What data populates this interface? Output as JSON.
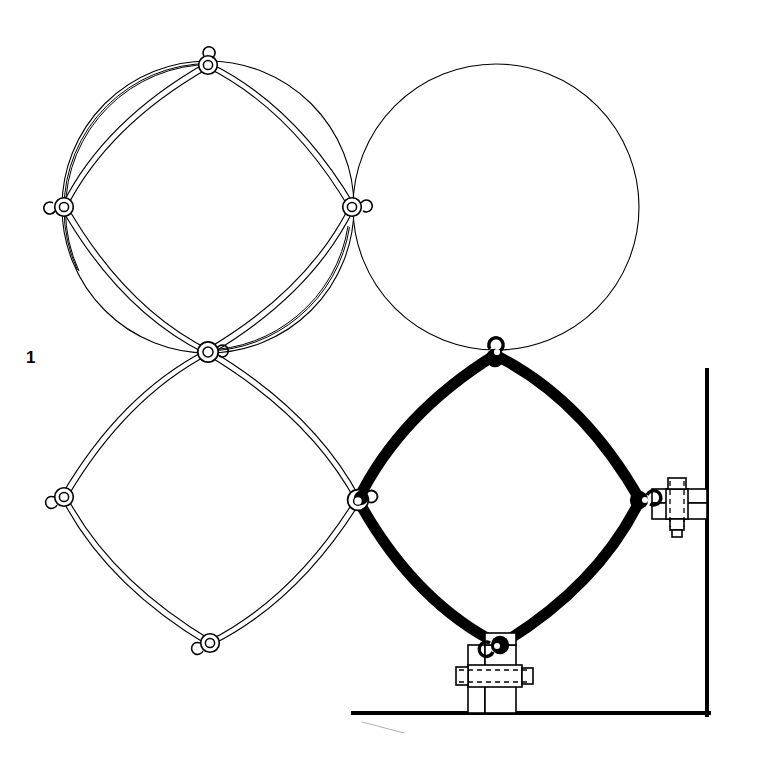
{
  "figure": {
    "label": "1",
    "label_position": {
      "x": 26,
      "y": 349
    },
    "background_color": "#ffffff",
    "line_color": "#000000",
    "canvas": {
      "width": 762,
      "height": 784
    }
  },
  "style": {
    "thin_circle_stroke_width": 1.1,
    "light_member_outline_stroke_width": 1.2,
    "light_member_rod_width": 5.0,
    "bold_member_stroke_width": 11.0,
    "joint_ring_outer_radius": 9.5,
    "joint_ring_inner_radius": 4.6,
    "hardware_stroke_width": 1.6,
    "wall_stroke_width": 4.0,
    "floor_stroke_width": 4.0,
    "dashed_stroke_width": 1.4,
    "dash_pattern": "6,5"
  },
  "geometry": {
    "description": "Square lattice of four-bar concave arc cells; node pitch 145 px on a 45-degree-rotated grid",
    "node_pitch": 145,
    "arc_bulge_ratio": 0.3,
    "nodes": [
      {
        "id": "n-top",
        "x": 208,
        "y": 65,
        "type": "hook-joint",
        "state": "light"
      },
      {
        "id": "n-right-upper",
        "x": 352,
        "y": 207,
        "type": "hook-joint",
        "state": "light"
      },
      {
        "id": "n-left-upper",
        "x": 64,
        "y": 207,
        "type": "hook-joint",
        "state": "light"
      },
      {
        "id": "n-center",
        "x": 208,
        "y": 352,
        "type": "cross-joint",
        "state": "light"
      },
      {
        "id": "n-left-lower",
        "x": 64,
        "y": 497,
        "type": "end-joint",
        "state": "light"
      },
      {
        "id": "n-bottom",
        "x": 210,
        "y": 643,
        "type": "end-joint",
        "state": "light"
      },
      {
        "id": "n-mid",
        "x": 358,
        "y": 500,
        "type": "transition-joint",
        "state": "mixed"
      },
      {
        "id": "n-upper-bold",
        "x": 495,
        "y": 355,
        "type": "hook-joint",
        "state": "bold"
      },
      {
        "id": "n-right-bold",
        "x": 640,
        "y": 500,
        "type": "anchor-joint",
        "state": "bold"
      },
      {
        "id": "n-lower-bold",
        "x": 500,
        "y": 645,
        "type": "anchor-joint",
        "state": "bold"
      }
    ],
    "circles": [
      {
        "id": "circle-top-left",
        "cx": 208,
        "cy": 207,
        "r": 146,
        "state": "light"
      },
      {
        "id": "circle-top-right",
        "cx": 496,
        "cy": 207,
        "r": 143,
        "state": "light"
      }
    ],
    "light_members": [
      {
        "id": "m1",
        "from": "n-top",
        "to": "n-right-upper",
        "bulge": -0.3
      },
      {
        "id": "m2",
        "from": "n-right-upper",
        "to": "n-center",
        "bulge": -0.3
      },
      {
        "id": "m3",
        "from": "n-center",
        "to": "n-left-upper",
        "bulge": -0.3
      },
      {
        "id": "m4",
        "from": "n-left-upper",
        "to": "n-top",
        "bulge": -0.3
      },
      {
        "id": "m5",
        "from": "n-center",
        "to": "n-left-lower",
        "bulge": -0.3
      },
      {
        "id": "m6",
        "from": "n-left-lower",
        "to": "n-bottom",
        "bulge": -0.3
      },
      {
        "id": "m7",
        "from": "n-bottom",
        "to": "n-mid",
        "bulge": -0.3
      },
      {
        "id": "m8",
        "from": "n-mid",
        "to": "n-center",
        "bulge": -0.3
      }
    ],
    "bold_members": [
      {
        "id": "b1",
        "from": "n-mid",
        "to": "n-upper-bold",
        "bulge": -0.3
      },
      {
        "id": "b2",
        "from": "n-upper-bold",
        "to": "n-right-bold",
        "bulge": -0.3
      },
      {
        "id": "b3",
        "from": "n-right-bold",
        "to": "n-lower-bold",
        "bulge": -0.3
      },
      {
        "id": "b4",
        "from": "n-lower-bold",
        "to": "n-mid",
        "bulge": -0.3
      }
    ]
  },
  "structure": {
    "wall": {
      "id": "wall",
      "x": 707,
      "y_top": 370,
      "y_bottom": 715,
      "label": "vertical wall"
    },
    "floor": {
      "id": "floor",
      "y": 713,
      "x_left": 353,
      "x_right": 709,
      "label": "floor line"
    },
    "scratch_mark": {
      "x1": 362,
      "y1": 722,
      "x2": 404,
      "y2": 733
    }
  },
  "hardware": {
    "wall_bracket": {
      "id": "wall-bracket",
      "name": "wall mounting bracket",
      "anchor_node": "n-right-bold",
      "orientation": "vertical-bolt",
      "parts": [
        "hex-bolt-head",
        "upper-plate",
        "lower-plate",
        "hex-nut",
        "bolt-shank"
      ],
      "bounds": {
        "x": 648,
        "y": 478,
        "w": 60,
        "h": 70
      }
    },
    "floor_bracket": {
      "id": "floor-bracket",
      "name": "floor mounting bracket",
      "anchor_node": "n-lower-bold",
      "orientation": "horizontal-bolt",
      "parts": [
        "hex-bolt-head",
        "left-plate",
        "right-plate",
        "hex-nut",
        "bolt-shank"
      ],
      "bounds": {
        "x": 462,
        "y": 633,
        "w": 72,
        "h": 80
      }
    }
  }
}
